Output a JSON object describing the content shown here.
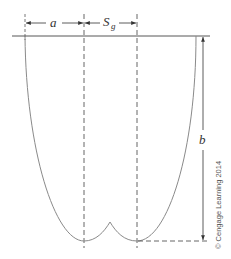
{
  "diagram": {
    "labels": {
      "a": "a",
      "s_main": "S",
      "s_sub": "g",
      "b": "b"
    },
    "copyright": "© Cengage Learning 2014",
    "colors": {
      "curve": "#8a8a8a",
      "lines": "#333333",
      "dashes": "#555555",
      "background": "#ffffff"
    }
  }
}
